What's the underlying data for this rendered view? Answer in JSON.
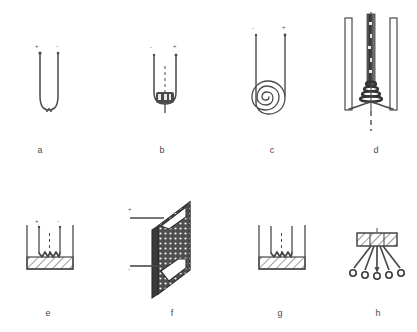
{
  "figure": {
    "background_color": "#ffffff",
    "ink_color": "#4a4a4a",
    "caption_font_size_px": 9,
    "panel_count": 8,
    "grid": {
      "rows": 2,
      "columns": 4
    }
  },
  "panels": [
    {
      "id": "a",
      "caption": "a",
      "name": "hairpin-wire-source",
      "description": "U-shaped hairpin wire filament with two vertical leads",
      "terminals": [
        {
          "label": "+",
          "position": "left"
        },
        {
          "label": "-",
          "position": "right"
        }
      ],
      "features": [
        "u-bend",
        "two-leads",
        "terminal-dots"
      ]
    },
    {
      "id": "b",
      "caption": "b",
      "name": "basket-source-with-charge",
      "description": "U-shaped wire holding a dark solid charge block at the bottom with a dashed center axis",
      "terminals": [
        {
          "label": "-",
          "position": "left"
        },
        {
          "label": "+",
          "position": "right"
        }
      ],
      "features": [
        "u-bend",
        "charge-block",
        "dashed-center-axis",
        "stem"
      ]
    },
    {
      "id": "c",
      "caption": "c",
      "name": "spiral-coil-source",
      "description": "Flat spiral coil filament between two vertical leads",
      "terminals": [
        {
          "label": "-",
          "position": "left"
        },
        {
          "label": "+",
          "position": "right"
        }
      ],
      "features": [
        "flat-spiral",
        "two-leads",
        "turns-4"
      ]
    },
    {
      "id": "d",
      "caption": "d",
      "name": "conical-helix-source",
      "description": "Two outer vertical electrode bars flanking a central hatched column with a tapered conical helical coil near the base and a dashed axis below",
      "terminals": [],
      "features": [
        "outer-bars-2",
        "central-hatched-column",
        "conical-helix",
        "dashed-lower-axis",
        "base-arms"
      ]
    },
    {
      "id": "e",
      "caption": "e",
      "name": "crucible-with-zigzag-heater",
      "description": "Open rectangular crucible with hatched melt layer and a W-shaped zigzag heater filament immersed, two leads above",
      "terminals": [
        {
          "label": "+",
          "position": "left"
        },
        {
          "label": "-",
          "position": "right"
        }
      ],
      "features": [
        "crucible-walls",
        "hatched-melt-layer",
        "zigzag-filament",
        "dashed-center-axis"
      ]
    },
    {
      "id": "f",
      "caption": "f",
      "name": "perforated-plate-source",
      "description": "Perspective view of a perforated (dotted) rectangular plate with two horizontal lead wires attached on the left edge",
      "terminals": [
        {
          "label": "+",
          "position": "top-left"
        },
        {
          "label": "-",
          "position": "bottom-left"
        }
      ],
      "features": [
        "3d-parallelogram-plate",
        "perforation-dot-grid",
        "two-lead-wires",
        "corner-tabs"
      ]
    },
    {
      "id": "g",
      "caption": "g",
      "name": "crucible-with-zigzag-heater-unmarked",
      "description": "Open rectangular crucible with hatched melt layer and W-shaped zigzag heater, leads unmarked",
      "terminals": [],
      "features": [
        "crucible-walls",
        "hatched-melt-layer",
        "zigzag-filament",
        "dashed-center-axis"
      ]
    },
    {
      "id": "h",
      "caption": "h",
      "name": "hatched-block-with-radiating-emitters",
      "description": "Hatched rectangular block with five radiating lines terminating in small circles below",
      "terminals": [],
      "features": [
        "hatched-block",
        "radiating-lines-5",
        "end-circles-5"
      ]
    }
  ]
}
